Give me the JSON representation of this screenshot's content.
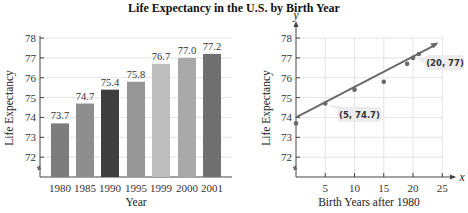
{
  "title": "Life Expectancy in the U.S. by Birth Year",
  "chart_data": [
    {
      "type": "bar",
      "title": "Life Expectancy in the U.S. by Birth Year",
      "xlabel": "Year",
      "ylabel": "Life Expectancy",
      "categories": [
        "1980",
        "1985",
        "1990",
        "1995",
        "1999",
        "2000",
        "2001"
      ],
      "values": [
        73.7,
        74.7,
        75.4,
        75.8,
        76.7,
        77.0,
        77.2
      ],
      "data_labels": [
        "73.7",
        "74.7",
        "75.4",
        "75.8",
        "76.7",
        "77.0",
        "77.2"
      ],
      "bar_colors": [
        "#7d7d7d",
        "#8e8e8e",
        "#3e3e3e",
        "#969696",
        "#bdbdbd",
        "#a9a9a9",
        "#707070"
      ],
      "yticks": [
        72,
        73,
        74,
        75,
        76,
        77,
        78
      ],
      "ylim": [
        71,
        78
      ],
      "axis_break": true,
      "grid": true
    },
    {
      "type": "scatter",
      "title": "",
      "xlabel": "Birth Years after 1980",
      "ylabel": "Life Expectancy",
      "x_axis_name": "x",
      "y_axis_name": "y",
      "points": [
        [
          0,
          73.7
        ],
        [
          5,
          74.7
        ],
        [
          10,
          75.4
        ],
        [
          15,
          75.8
        ],
        [
          19,
          76.7
        ],
        [
          20,
          77.0
        ],
        [
          21,
          77.2
        ]
      ],
      "trend_line": {
        "x_start": 0,
        "y_start": 74.0,
        "x_end": 24,
        "y_end": 77.68,
        "through": [
          [
            5,
            74.7
          ],
          [
            20,
            77
          ]
        ]
      },
      "annotations": [
        "(5, 74.7)",
        "(20, 77)"
      ],
      "xticks": [
        5,
        10,
        15,
        20,
        25
      ],
      "yticks": [
        72,
        73,
        74,
        75,
        76,
        77,
        78
      ],
      "xlim": [
        0,
        26
      ],
      "ylim": [
        71,
        78
      ],
      "axis_break": true,
      "grid": true
    }
  ]
}
